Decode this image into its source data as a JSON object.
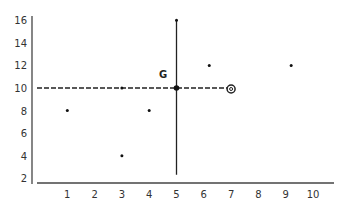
{
  "chart_data": {
    "type": "scatter",
    "title": "",
    "xlabel": "",
    "ylabel": "",
    "xlim": [
      0,
      11
    ],
    "ylim": [
      2,
      16
    ],
    "grid": false,
    "x_ticks": [
      1,
      2,
      3,
      4,
      5,
      6,
      7,
      8,
      9,
      10
    ],
    "y_ticks": [
      2,
      4,
      6,
      8,
      10,
      12,
      14,
      16
    ],
    "points": [
      {
        "x": 1,
        "y": 8
      },
      {
        "x": 3,
        "y": 10
      },
      {
        "x": 3,
        "y": 4
      },
      {
        "x": 4,
        "y": 8
      },
      {
        "x": 5,
        "y": 16
      },
      {
        "x": 6.2,
        "y": 12
      },
      {
        "x": 9.2,
        "y": 12
      }
    ],
    "highlight_point": {
      "label": "G",
      "x": 5,
      "y": 10
    },
    "circle_marker": {
      "x": 7,
      "y": 10
    },
    "reference_lines": [
      {
        "orientation": "vertical",
        "x": 5,
        "y_from": 2.5,
        "y_to": 16,
        "style": "solid"
      },
      {
        "orientation": "horizontal",
        "y": 10,
        "x_from": 0,
        "x_to": 7,
        "style": "dashed"
      }
    ],
    "annotations": [
      {
        "text": "G",
        "x": 4.8,
        "y": 11
      }
    ],
    "colors": {
      "axis": "#444444",
      "points": "#111111",
      "lines": "#222222"
    }
  }
}
